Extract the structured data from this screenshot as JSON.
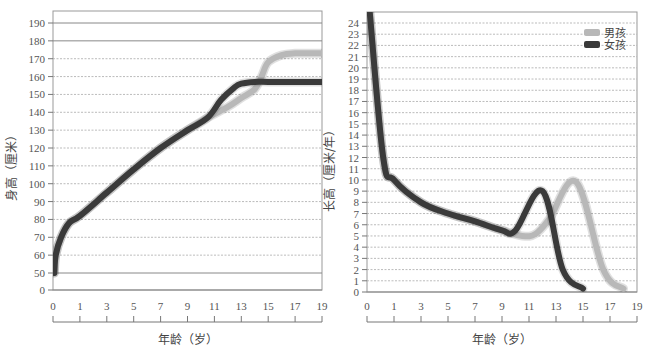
{
  "chart_data": [
    {
      "type": "line",
      "title": "",
      "xlabel": "年龄（岁）",
      "ylabel": "身高（厘米）",
      "x_ticks": [
        "0",
        "1",
        "3",
        "5",
        "7",
        "9",
        "11",
        "13",
        "15",
        "17",
        "19"
      ],
      "y_ticks": [
        "0",
        "50",
        "60",
        "70",
        "80",
        "90",
        "100",
        "110",
        "120",
        "130",
        "140",
        "150",
        "160",
        "170",
        "180",
        "190"
      ],
      "ylim": [
        0,
        190
      ],
      "grid": true,
      "series": [
        {
          "name": "男孩",
          "color": "#b8b8b8",
          "x": [
            0.05,
            0.1,
            0.3,
            0.6,
            1,
            3,
            5,
            7,
            9,
            10.5,
            12,
            13,
            14,
            14.5,
            15,
            16,
            17,
            19
          ],
          "y": [
            50,
            60,
            70,
            78,
            82,
            95,
            108,
            120,
            130,
            137,
            143,
            148,
            153,
            160,
            168,
            172,
            173,
            173
          ]
        },
        {
          "name": "女孩",
          "color": "#3a3a3a",
          "x": [
            0.05,
            0.1,
            0.3,
            0.6,
            1,
            3,
            5,
            7,
            9,
            10.5,
            11.5,
            12.5,
            13,
            14,
            15,
            17,
            19
          ],
          "y": [
            50,
            60,
            70,
            78,
            82,
            95,
            108,
            120,
            130,
            137,
            147,
            154,
            156,
            157,
            157,
            157,
            157
          ]
        }
      ]
    },
    {
      "type": "line",
      "title": "",
      "xlabel": "年龄（岁）",
      "ylabel": "长高（厘米/年）",
      "x_ticks": [
        "0",
        "1",
        "3",
        "5",
        "7",
        "9",
        "11",
        "13",
        "15",
        "17",
        "19"
      ],
      "y_ticks": [
        "0",
        "1",
        "2",
        "3",
        "4",
        "5",
        "6",
        "7",
        "8",
        "9",
        "10",
        "11",
        "12",
        "13",
        "14",
        "15",
        "16",
        "17",
        "18",
        "19",
        "20",
        "21",
        "22",
        "23",
        "24"
      ],
      "ylim": [
        0,
        24
      ],
      "grid": true,
      "legend": {
        "position": "top-right",
        "entries": [
          "男孩",
          "女孩"
        ]
      },
      "series": [
        {
          "name": "男孩",
          "color": "#b8b8b8",
          "x": [
            0.1,
            0.6,
            1,
            3,
            5,
            7,
            9,
            10.5,
            11.5,
            12.5,
            14.5,
            16.5,
            18
          ],
          "y": [
            25,
            12,
            10,
            8,
            7,
            6.3,
            5.5,
            5,
            5.2,
            6.5,
            9.8,
            2,
            0.3
          ]
        },
        {
          "name": "女孩",
          "color": "#3a3a3a",
          "x": [
            0.1,
            0.6,
            1,
            3,
            5,
            7,
            9,
            10,
            12,
            13.5,
            15
          ],
          "y": [
            25,
            12,
            10,
            8,
            7,
            6.3,
            5.5,
            5.5,
            9,
            2,
            0.3
          ]
        }
      ]
    }
  ],
  "left_chart": {
    "ylabel": "身高（厘米）",
    "xlabel": "年龄（岁）"
  },
  "right_chart": {
    "ylabel": "长高（厘米/年）",
    "xlabel": "年龄（岁）",
    "legend": {
      "boy": "男孩",
      "girl": "女孩"
    }
  },
  "colors": {
    "boy": "#b8b8b8",
    "girl": "#3a3a3a",
    "grid": "#aaaaaa",
    "axis": "#777777"
  }
}
